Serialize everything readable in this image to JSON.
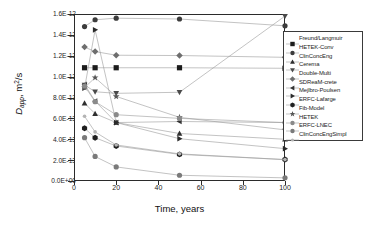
{
  "chart_data": {
    "type": "line",
    "title": "",
    "xlabel": "Time, years",
    "ylabel": "D_app, m2/s",
    "ylabel_parts": {
      "symbol": "D",
      "subscript": "app",
      "unit": "m",
      "unit_sup": "2",
      "unit_tail": "/s"
    },
    "xlim": [
      0,
      100
    ],
    "ylim": [
      0,
      1.6e-12
    ],
    "xticks": [
      0,
      20,
      40,
      60,
      80,
      100
    ],
    "xtick_labels": [
      "0",
      "20",
      "40",
      "60",
      "80",
      "100"
    ],
    "yticks": [
      0,
      2e-13,
      4e-13,
      6e-13,
      8e-13,
      1e-12,
      1.2e-12,
      1.4e-12,
      1.6e-12
    ],
    "ytick_labels": [
      "0.0E+00",
      "2.0E-13",
      "4.0E-13",
      "6.0E-13",
      "8.0E-13",
      "1.0E-12",
      "1.2E-12",
      "1.4E-12",
      "1.6E-12"
    ],
    "grid": false,
    "legend_position": "right",
    "x": [
      5,
      10,
      20,
      50,
      100
    ],
    "series": [
      {
        "name": "Freund/Langmuir",
        "marker": "square",
        "color": "#1b1b1b",
        "values": [
          1.085e-12,
          1.085e-12,
          1.085e-12,
          1.085e-12,
          1.08e-12
        ]
      },
      {
        "name": "HETEK-Conv",
        "marker": "circle",
        "color": "#3c3c3c",
        "values": [
          1.48e-12,
          1.545e-12,
          1.56e-12,
          1.552e-12,
          1.487e-12
        ]
      },
      {
        "name": "ClinConcEng",
        "marker": "triangle-up",
        "color": "#2e2e2e",
        "values": [
          7.45e-13,
          6.45e-13,
          5.6e-13,
          4.55e-13,
          4e-13
        ]
      },
      {
        "name": "Cerema",
        "marker": "triangle-down",
        "color": "#4a4a4a",
        "values": [
          9.2e-13,
          8.55e-13,
          8.4e-13,
          8.5e-13,
          1.58e-12
        ]
      },
      {
        "name": "Double-Multi",
        "marker": "diamond",
        "color": "#6e6e6e",
        "values": [
          1.283e-12,
          1.24e-12,
          1.205e-12,
          1.202e-12,
          1.185e-12
        ]
      },
      {
        "name": "SDReaM-crete",
        "marker": "triangle-left",
        "color": "#333333",
        "values": [
          9.25e-13,
          7.65e-13,
          5.6e-13,
          5.7e-13,
          5.6e-13
        ]
      },
      {
        "name": "Mejlbro-Poulsen",
        "marker": "triangle-right",
        "color": "#2a2a2a",
        "values": [
          8.9e-13,
          1.448e-12,
          5.6e-13,
          4.05e-13,
          3.1e-13
        ]
      },
      {
        "name": "ERFC-Lafarge",
        "marker": "hexagon",
        "color": "#1f1f1f",
        "values": [
          5.05e-13,
          4.15e-13,
          3.35e-13,
          2.55e-13,
          2.05e-13
        ]
      },
      {
        "name": "Fib-Model",
        "marker": "star",
        "color": "#555555",
        "values": [
          8.95e-13,
          9.9e-13,
          8.1e-13,
          6.1e-13,
          4.9e-13
        ]
      },
      {
        "name": "HETEK",
        "marker": "circle-light",
        "color": "#8a8a8a",
        "values": [
          9.1e-13,
          7.6e-13,
          6.35e-13,
          6e-13,
          5.6e-13
        ]
      },
      {
        "name": "ERFC-LNEC",
        "marker": "circle-gray",
        "color": "#7a7a7a",
        "values": [
          4.15e-13,
          2.35e-13,
          1.35e-13,
          5.5e-14,
          3e-14
        ]
      },
      {
        "name": "ClinConcEngSimpl",
        "marker": "dot",
        "color": "#b4b4b4",
        "values": [
          6.2e-13,
          4.7e-13,
          3.45e-13,
          2.6e-13,
          2.05e-13
        ]
      }
    ]
  }
}
